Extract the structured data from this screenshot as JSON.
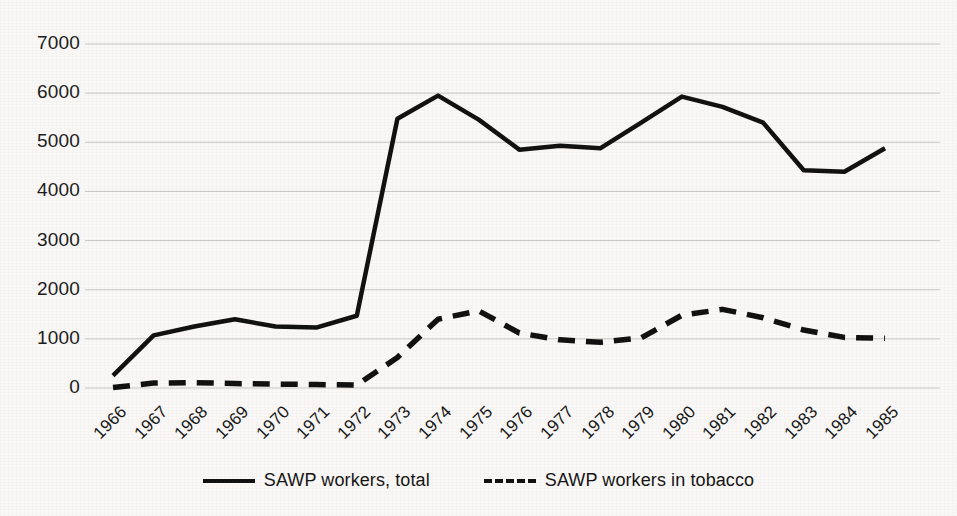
{
  "chart_data": {
    "type": "line",
    "title": "",
    "subtitle": "",
    "xlabel": "",
    "ylabel": "",
    "xlim": [
      1966,
      1985
    ],
    "ylim": [
      0,
      7000
    ],
    "grid": true,
    "legend_position": "bottom",
    "categories": [
      "1966",
      "1967",
      "1968",
      "1969",
      "1970",
      "1971",
      "1972",
      "1973",
      "1974",
      "1975",
      "1976",
      "1977",
      "1978",
      "1979",
      "1980",
      "1981",
      "1982",
      "1983",
      "1984",
      "1985"
    ],
    "x": [
      1966,
      1967,
      1968,
      1969,
      1970,
      1971,
      1972,
      1973,
      1974,
      1975,
      1976,
      1977,
      1978,
      1979,
      1980,
      1981,
      1982,
      1983,
      1984,
      1985
    ],
    "yticks": [
      "0",
      "1000",
      "2000",
      "3000",
      "4000",
      "5000",
      "6000",
      "7000"
    ],
    "series": [
      {
        "name": "SAWP workers, total",
        "style": "solid",
        "color": "#101010",
        "values": [
          250,
          1070,
          1250,
          1400,
          1250,
          1230,
          1470,
          5480,
          5950,
          5460,
          4850,
          4930,
          4880,
          5400,
          5930,
          5720,
          5400,
          4430,
          4400,
          4880
        ]
      },
      {
        "name": "SAWP workers in tobacco",
        "style": "dashed",
        "color": "#101010",
        "values": [
          10,
          100,
          110,
          90,
          80,
          70,
          60,
          620,
          1400,
          1570,
          1120,
          980,
          930,
          1020,
          1480,
          1600,
          1430,
          1180,
          1030,
          1010
        ]
      }
    ]
  },
  "legend": {
    "entries": [
      {
        "label": "SAWP workers, total",
        "style": "solid"
      },
      {
        "label": "SAWP workers in tobacco",
        "style": "dashed"
      }
    ]
  },
  "axes": {
    "y_tick_labels": [
      "7000",
      "6000",
      "5000",
      "4000",
      "3000",
      "2000",
      "1000",
      "0"
    ],
    "x_tick_labels": [
      "1966",
      "1967",
      "1968",
      "1969",
      "1970",
      "1971",
      "1972",
      "1973",
      "1974",
      "1975",
      "1976",
      "1977",
      "1978",
      "1979",
      "1980",
      "1981",
      "1982",
      "1983",
      "1984",
      "1985"
    ]
  }
}
